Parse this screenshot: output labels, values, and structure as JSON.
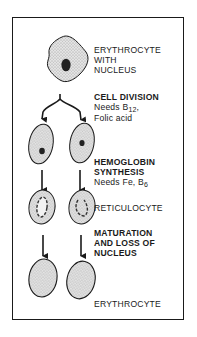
{
  "diagram": {
    "stages": [
      {
        "id": "erythrocyte-with-nucleus",
        "label_lines": [
          "ERYTHROCYTE",
          "WITH",
          "NUCLEUS"
        ]
      },
      {
        "id": "cell-division",
        "heading": "CELL DIVISION",
        "needs_prefix": "Needs B",
        "needs_sub": "12",
        "needs_suffix": ",",
        "needs_line2": "Folic acid"
      },
      {
        "id": "hemoglobin-synthesis",
        "heading_lines": [
          "HEMOGLOBIN",
          "SYNTHESIS"
        ],
        "needs_prefix": "Needs Fe, B",
        "needs_sub": "6"
      },
      {
        "id": "reticulocyte",
        "label": "RETICULOCYTE"
      },
      {
        "id": "maturation",
        "heading_lines": [
          "MATURATION",
          "AND LOSS OF",
          "NUCLEUS"
        ]
      },
      {
        "id": "erythrocyte",
        "label": "ERYTHROCYTE"
      }
    ],
    "colors": {
      "ink": "#1a1a1a",
      "cell_fill": "#d9d9d9",
      "nucleus": "#222222",
      "background": "#ffffff"
    }
  }
}
